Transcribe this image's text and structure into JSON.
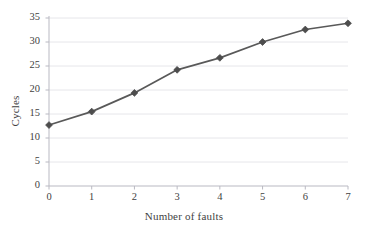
{
  "chart_data": {
    "type": "line",
    "title": "",
    "xlabel": "Number of faults",
    "ylabel": "Cycles",
    "x": [
      0,
      1,
      2,
      3,
      4,
      5,
      6,
      7
    ],
    "values": [
      12.7,
      15.5,
      19.4,
      24.2,
      26.7,
      30.0,
      32.6,
      33.9
    ],
    "series": [
      {
        "name": "Cycles",
        "values": [
          12.7,
          15.5,
          19.4,
          24.2,
          26.7,
          30.0,
          32.6,
          33.9
        ]
      }
    ],
    "xlim": [
      0,
      7
    ],
    "ylim": [
      0,
      35
    ],
    "x_ticks": [
      "0",
      "1",
      "2",
      "3",
      "4",
      "5",
      "6",
      "7"
    ],
    "y_ticks": [
      "0",
      "5",
      "10",
      "15",
      "20",
      "25",
      "30",
      "35"
    ],
    "grid": "horizontal",
    "legend": "none",
    "marker": "diamond",
    "colors": {
      "line": "#595959",
      "marker": "#4d4d4d",
      "grid": "#e3e3e8",
      "axis": "#b9b9c2",
      "text": "#3f3f3f",
      "background": "#ffffff"
    }
  }
}
